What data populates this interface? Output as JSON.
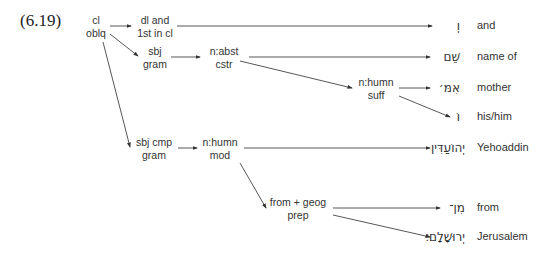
{
  "example_number": "(6.19)",
  "nodes": {
    "root": {
      "line1": "cl",
      "line2": "oblq"
    },
    "dl": {
      "line1": "dl and",
      "line2": "1st in cl"
    },
    "sbj": {
      "line1": "sbj",
      "line2": "gram"
    },
    "abst": {
      "line1": "n:abst",
      "line2": "cstr"
    },
    "humn_suff": {
      "line1": "n:humn",
      "line2": "suff"
    },
    "sbj_cmp": {
      "line1": "sbj cmp",
      "line2": "gram"
    },
    "humn_mod": {
      "line1": "n:humn",
      "line2": "mod"
    },
    "from_geog": {
      "line1": "from + geog",
      "line2": "prep"
    }
  },
  "leaves": [
    {
      "hebrew": "וְ",
      "gloss": "and"
    },
    {
      "hebrew": "שֵׁם",
      "gloss": "name of"
    },
    {
      "hebrew": "אִמּ׳",
      "gloss": "mother"
    },
    {
      "hebrew": "וֹ",
      "gloss": "his/him"
    },
    {
      "hebrew": "יְהוֹעַדִּין",
      "gloss": "Yehoaddin"
    },
    {
      "hebrew": "מִן־",
      "gloss": "from"
    },
    {
      "hebrew": "יְרוּשָׁלָם׃",
      "gloss": "Jerusalem"
    }
  ],
  "colors": {
    "line": "#333333",
    "text": "#333333"
  }
}
